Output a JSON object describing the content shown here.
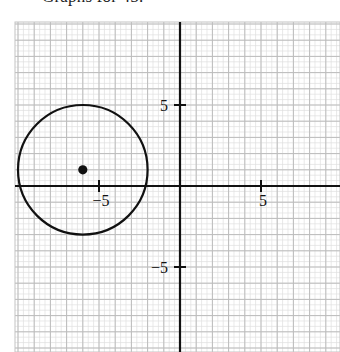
{
  "caption": {
    "text": "Graphs for 45."
  },
  "chart_data": {
    "type": "scatter",
    "title": "",
    "subtitle": "",
    "xlabel": "",
    "ylabel": "",
    "xlim": [
      -10.2,
      9.6
    ],
    "ylim": [
      -9.8,
      10.1
    ],
    "grid": true,
    "grid_major_step": 1,
    "grid_minor_step": 0.3333,
    "legend": "none",
    "axes": {
      "x_axis_label_positive": "5",
      "x_axis_label_negative": "−5",
      "y_axis_label_positive": "5",
      "y_axis_label_negative": "−5",
      "x_ticks": [
        -5,
        5
      ],
      "y_ticks": [
        -5,
        5
      ],
      "tick_label_texts": [
        "−5",
        "5"
      ]
    },
    "shapes": [
      {
        "kind": "circle",
        "name": "graphed-circle",
        "center": [
          -6,
          1
        ],
        "radius": 4,
        "stroke": "#111111",
        "fill": "none",
        "stroke_width": 2.2
      },
      {
        "kind": "point",
        "name": "circle-center-point",
        "center": [
          -6,
          1
        ],
        "marker": "filled-dot",
        "radius_px": 4.6,
        "fill": "#111111"
      }
    ],
    "annotations": []
  },
  "style": {
    "background": "#ffffff",
    "axis_color": "#111111",
    "grid_major_color": "#b9b9b9",
    "grid_minor_color": "#dcdcdc",
    "curve_color": "#111111",
    "label_color": "#111111"
  },
  "geometry": {
    "origin_px": [
      180,
      186
    ],
    "unit_px": 16.2,
    "plot_left_px": 15,
    "plot_top_px": 22,
    "plot_right_px": 340,
    "plot_bottom_px": 352
  }
}
